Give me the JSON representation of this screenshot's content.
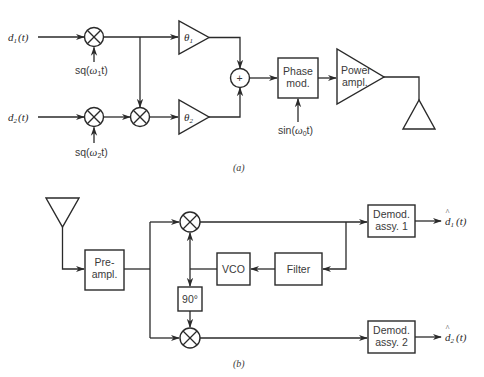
{
  "diagram": {
    "part_a": {
      "caption": "(a)",
      "inputs": {
        "d1": {
          "base": "d",
          "sub": "1",
          "arg": "(t)"
        },
        "d2": {
          "base": "d",
          "sub": "2",
          "arg": "(t)"
        }
      },
      "carriers": {
        "sq1": {
          "pre": "sq(",
          "w": "ω",
          "sub": "1",
          "post": "t)"
        },
        "sq2": {
          "pre": "sq(",
          "w": "ω",
          "sub": "2",
          "post": "t)"
        }
      },
      "gains": {
        "theta1": {
          "base": "θ",
          "sub": "1"
        },
        "theta2": {
          "base": "θ",
          "sub": "2"
        }
      },
      "summer_symbol": "+",
      "phase_mod": {
        "line1": "Phase",
        "line2": "mod."
      },
      "phase_carrier": {
        "pre": "sin(",
        "w": "ω",
        "sub": "0",
        "post": "t)"
      },
      "power_amp": {
        "line1": "Power",
        "line2": "ampl."
      }
    },
    "part_b": {
      "caption": "(b)",
      "preamp": {
        "line1": "Pre-",
        "line2": "ampl."
      },
      "vco": "VCO",
      "filter": "Filter",
      "phase_shift": "90°",
      "demod1": {
        "line1": "Demod.",
        "line2": "assy. 1"
      },
      "demod2": {
        "line1": "Demod.",
        "line2": "assy. 2"
      },
      "outputs": {
        "d1hat": {
          "hat": "^",
          "base": "d",
          "sub": "1",
          "arg": "(t)"
        },
        "d2hat": {
          "hat": "^",
          "base": "d",
          "sub": "2",
          "arg": "(t)"
        }
      }
    }
  }
}
